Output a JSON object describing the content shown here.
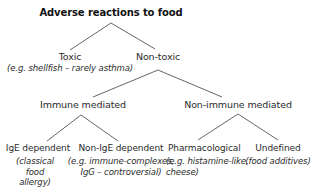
{
  "diagram": {
    "title": "Adverse reactions to food",
    "nodes": {
      "toxic": {
        "label": "Toxic",
        "example": "(e.g. shellfish – rarely asthma)"
      },
      "non_toxic": {
        "label": "Non-toxic"
      },
      "immune": {
        "label": "Immune mediated"
      },
      "non_immune": {
        "label": "Non-immune mediated"
      },
      "ige": {
        "label": "IgE dependent",
        "example_lines": [
          "(classical",
          "food",
          "allergy)"
        ]
      },
      "non_ige": {
        "label": "Non-IgE dependent",
        "example_lines": [
          "(e.g. immune-complexes,",
          "IgG – controversial)"
        ]
      },
      "pharmacological": {
        "label": "Pharmacological",
        "example_lines": [
          "(e.g. histamine-like,",
          "cheese)"
        ]
      },
      "undefined": {
        "label": "Undefined",
        "example": "(food additives)"
      }
    },
    "edges": [
      [
        "title",
        "toxic"
      ],
      [
        "title",
        "non_toxic"
      ],
      [
        "non_toxic",
        "immune"
      ],
      [
        "non_toxic",
        "non_immune"
      ],
      [
        "immune",
        "ige"
      ],
      [
        "immune",
        "non_ige"
      ],
      [
        "non_immune",
        "pharmacological"
      ],
      [
        "non_immune",
        "undefined"
      ]
    ],
    "line_color": "#555555"
  }
}
